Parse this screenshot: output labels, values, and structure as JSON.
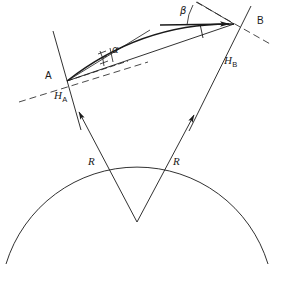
{
  "figure": {
    "width": 282,
    "height": 285,
    "background_color": "#ffffff",
    "stroke_color": "#1a1a1a"
  },
  "labels": {
    "point_a": "A",
    "point_b": "B",
    "height_a": "H",
    "height_a_sub": "A",
    "height_b": "H",
    "height_b_sub": "B",
    "radius_left": "R",
    "radius_right": "R",
    "angle_alpha": "α",
    "angle_beta": "β"
  },
  "geometry": {
    "point_a": {
      "x": 66,
      "y": 80
    },
    "point_b": {
      "x": 235,
      "y": 23
    },
    "sphere_center": {
      "x": 137,
      "y": 222
    },
    "sphere_radius": 137,
    "arc_start_deg": 198,
    "arc_end_deg": 342
  },
  "elements": [
    {
      "name": "earth-surface-arc",
      "kind": "arc",
      "style": "solid"
    },
    {
      "name": "radius-line-a",
      "kind": "line",
      "style": "solid",
      "arrow": "toward-a",
      "label": "R"
    },
    {
      "name": "radius-line-b",
      "kind": "line",
      "style": "solid",
      "arrow": "toward-b",
      "label": "R"
    },
    {
      "name": "meridian-line-a",
      "kind": "line",
      "style": "solid",
      "label": "H_A"
    },
    {
      "name": "meridian-line-b",
      "kind": "line",
      "style": "solid",
      "label": "H_B"
    },
    {
      "name": "horizon-dashed-a",
      "kind": "line",
      "style": "dashed"
    },
    {
      "name": "horizon-dashed-b",
      "kind": "line",
      "style": "dashed"
    },
    {
      "name": "great-circle-path",
      "kind": "curve",
      "style": "solid-thick",
      "arrow": "toward-b"
    },
    {
      "name": "rhumb-line-path",
      "kind": "line",
      "style": "solid"
    },
    {
      "name": "alpha-angle-arc",
      "kind": "arc",
      "ticks": 2
    },
    {
      "name": "beta-angle-arc",
      "kind": "arc",
      "ticks": 0
    },
    {
      "name": "beta-reference-line",
      "kind": "line",
      "style": "solid-thick-horizontal"
    },
    {
      "name": "tick-mark-b",
      "kind": "tick"
    }
  ]
}
